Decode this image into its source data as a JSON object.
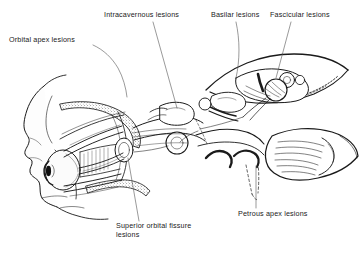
{
  "figure": {
    "background_color": "#ffffff",
    "ink_color": "#1a1a1a",
    "width": 359,
    "height": 255
  },
  "labels": {
    "orbital_apex": "Orbital apex lesions",
    "intracavernous": "Intracavernous lesions",
    "basilar": "Basilar lesions",
    "fascicular": "Fascicular lesions",
    "superior_orbital_fissure": "Superior orbital fissure\nlesions",
    "petrous_apex": "Petrous apex lesions"
  },
  "anatomy": {
    "regions": [
      "head-profile",
      "orbit",
      "eye-globe",
      "extraocular-muscles",
      "optic-nerve",
      "cavernous-sinus",
      "petrous-apex",
      "brainstem",
      "cerebellum",
      "tentorium"
    ]
  }
}
